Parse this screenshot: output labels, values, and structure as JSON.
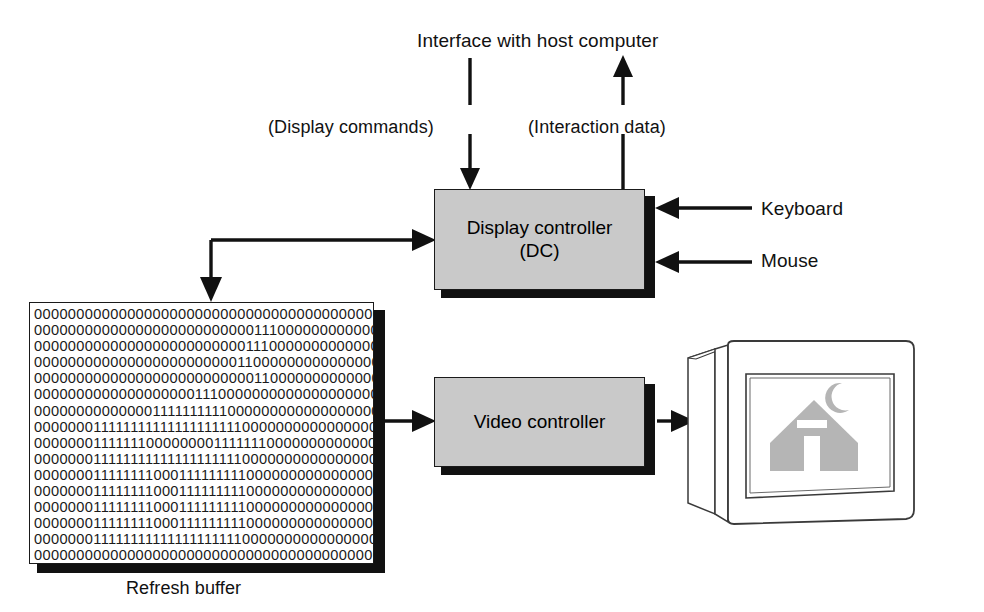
{
  "diagram": {
    "labels": {
      "host_interface": "Interface with host computer",
      "display_commands": "(Display commands)",
      "interaction_data": "(Interaction data)",
      "keyboard": "Keyboard",
      "mouse": "Mouse",
      "refresh_buffer": "Refresh buffer"
    },
    "boxes": {
      "display_controller": {
        "line1": "Display controller",
        "line2": "(DC)"
      },
      "video_controller": {
        "line1": "Video controller"
      }
    },
    "colors": {
      "box_fill": "#c9c9c9",
      "box_stroke": "#1a1a1a",
      "shadow": "#111111",
      "background": "#ffffff",
      "screen_image_fill": "#b5b5b5"
    },
    "refresh_buffer": {
      "columns": 48,
      "rows": 16,
      "bits": [
        "000000000000000000000000000000000000000000000000",
        "000000000000000000000000001110000000000000000000",
        "000000000000000000000000011100000000000000000000",
        "000000000000000000000000110000000000000000000000",
        "000000000000000000000000001100000000000000000000",
        "000000000000000000011100000000000000000000000000",
        "000000000000001111111111000000000000000000000000",
        "000000011111111111111111111000000000000000000000",
        "000000011111110000000011111110000000000000000000",
        "000000011111111111111111111000000000000000000000",
        "000000011111111000111111111000000000000000000000",
        "000000011111111000111111111000000000000000000000",
        "000000011111111000111111111000000000000000000000",
        "000000011111111000111111111000000000000000000000",
        "000000011111111111111111111000000000000000000000",
        "000000000000000000000000000000000000000000000000"
      ]
    },
    "connections": [
      {
        "name": "host-to-dc",
        "label": "(Display commands)",
        "direction": "down"
      },
      {
        "name": "dc-to-host",
        "label": "(Interaction data)",
        "direction": "up"
      },
      {
        "name": "keyboard-to-dc",
        "label": "Keyboard",
        "direction": "left"
      },
      {
        "name": "mouse-to-dc",
        "label": "Mouse",
        "direction": "left"
      },
      {
        "name": "buffer-to-dc",
        "label": "",
        "direction": "right-up"
      },
      {
        "name": "dc-to-buffer",
        "label": "",
        "direction": "down"
      },
      {
        "name": "buffer-to-vc",
        "label": "",
        "direction": "right"
      },
      {
        "name": "vc-to-monitor",
        "label": "",
        "direction": "right"
      }
    ],
    "monitor": {
      "screen_content": "house-with-crescent-moon"
    }
  }
}
